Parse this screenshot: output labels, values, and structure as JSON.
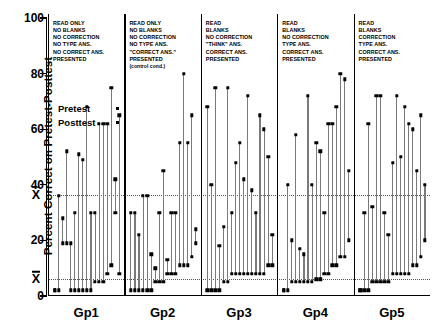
{
  "chart_data": {
    "type": "scatter",
    "title": "",
    "xlabel": "",
    "ylabel": "Percent Correct on Pretest-Posttest",
    "ylim": [
      0,
      100
    ],
    "yticks": [
      0,
      20,
      40,
      60,
      80,
      100
    ],
    "ytick_labels": [
      "0",
      "20",
      "40",
      "60",
      "80",
      "100"
    ],
    "grid": false,
    "legend_position": "upper-left-inside",
    "series": [
      {
        "name": "Pretest",
        "marker": "dot",
        "color": "#000000"
      },
      {
        "name": "Posttest",
        "marker": "dot",
        "color": "#000000"
      }
    ],
    "annotations": [
      {
        "label": "X̄",
        "value": 36.5,
        "style": "dotted-line",
        "note": "posttest mean"
      },
      {
        "label": "X̄",
        "value": 6.0,
        "style": "dotted-line",
        "note": "pretest mean"
      }
    ],
    "categories": [
      "Gp1",
      "Gp2",
      "Gp3",
      "Gp4",
      "Gp5"
    ],
    "groups": [
      {
        "name": "Gp1",
        "caption": [
          "READ ONLY",
          "NO BLANKS",
          "NO CORRECTION",
          "NO TYPE ANS.",
          "NO CORRECT ANS.",
          "PRESENTED"
        ],
        "subcaption": "",
        "pretest": [
          2,
          2,
          19,
          19,
          2,
          2,
          2,
          2,
          2,
          2,
          5,
          5,
          5,
          8,
          11,
          30,
          8
        ],
        "posttest": [
          2,
          36,
          28,
          52,
          19,
          30,
          51,
          49,
          68,
          30,
          30,
          62,
          62,
          62,
          75,
          42,
          65
        ]
      },
      {
        "name": "Gp2",
        "caption": [
          "READ ONLY",
          "NO BLANKS",
          "NO CORRECTION",
          "NO TYPE ANS.",
          "\"CORRECT ANS.\"",
          "PRESENTED"
        ],
        "subcaption": "(control cond.)",
        "pretest": [
          2,
          2,
          2,
          2,
          2,
          2,
          5,
          5,
          5,
          8,
          8,
          8,
          11,
          11,
          11,
          14,
          19
        ],
        "posttest": [
          30,
          30,
          22,
          36,
          36,
          15,
          10,
          30,
          45,
          13,
          30,
          30,
          55,
          80,
          55,
          65,
          24
        ]
      },
      {
        "name": "Gp3",
        "caption": [
          "READ",
          "BLANKS",
          "NO CORRECTION",
          "\"THINK\" ANS.",
          "CORRECT ANS.",
          "PRESENTED"
        ],
        "subcaption": "",
        "pretest": [
          2,
          2,
          2,
          2,
          5,
          5,
          8,
          8,
          8,
          8,
          8,
          8,
          8,
          8,
          8,
          11,
          11
        ],
        "posttest": [
          68,
          40,
          75,
          18,
          25,
          75,
          30,
          48,
          55,
          42,
          72,
          38,
          30,
          65,
          60,
          50,
          22
        ]
      },
      {
        "name": "Gp4",
        "caption": [
          "READ",
          "BLANKS",
          "NO CORRECTION",
          "TYPE ANS.",
          "CORRECT ANS.",
          "PRESENTED"
        ],
        "subcaption": "",
        "pretest": [
          2,
          2,
          5,
          5,
          5,
          5,
          5,
          5,
          6,
          6,
          8,
          8,
          11,
          11,
          14,
          14,
          20
        ],
        "posttest": [
          2,
          40,
          20,
          58,
          17,
          15,
          72,
          40,
          55,
          52,
          30,
          62,
          62,
          68,
          80,
          78,
          45
        ]
      },
      {
        "name": "Gp5",
        "caption": [
          "READ",
          "BLANKS",
          "CORRECTION",
          "TYPE ANS.",
          "CORRECT ANS.",
          "PRESENTED"
        ],
        "subcaption": "",
        "pretest": [
          2,
          2,
          2,
          5,
          5,
          5,
          5,
          5,
          8,
          8,
          8,
          8,
          8,
          11,
          11,
          14,
          20
        ],
        "posttest": [
          2,
          30,
          62,
          32,
          72,
          72,
          30,
          22,
          48,
          72,
          50,
          68,
          62,
          60,
          45,
          65,
          40
        ]
      }
    ]
  },
  "axis": {
    "y_title": "Percent Correct on Pretest-Posttest",
    "mean_symbol": "X"
  },
  "legend": {
    "pretest_label": "Pretest",
    "posttest_label": "Posttest"
  }
}
